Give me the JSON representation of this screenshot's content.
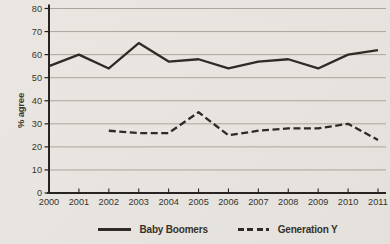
{
  "colors": {
    "background": "#e8e5e0",
    "line": "#2e2b26",
    "grid": "#a49e95",
    "axis": "#262320",
    "text": "#38342d"
  },
  "chart_data": {
    "type": "line",
    "title": "",
    "xlabel": "",
    "ylabel": "% agree",
    "ylim": [
      0,
      80
    ],
    "ytick_interval": 10,
    "grid": "horizontal",
    "legend_position": "bottom",
    "categories": [
      "2000",
      "2001",
      "2002",
      "2003",
      "2004",
      "2005",
      "2006",
      "2007",
      "2008",
      "2009",
      "2010",
      "2011"
    ],
    "series": [
      {
        "name": "Baby Boomers",
        "line_style": "solid",
        "values": [
          55,
          60,
          54,
          65,
          57,
          58,
          54,
          57,
          58,
          54,
          60,
          62
        ]
      },
      {
        "name": "Generation Y",
        "line_style": "dashed",
        "values": [
          null,
          null,
          27,
          26,
          26,
          35,
          25,
          27,
          28,
          28,
          30,
          23
        ]
      }
    ]
  }
}
